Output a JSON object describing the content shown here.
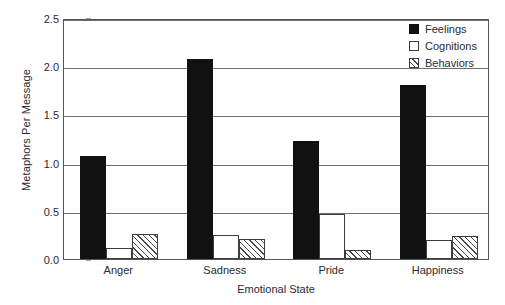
{
  "chart_data": {
    "type": "bar",
    "title": "",
    "subtitle": "",
    "xlabel": "Emotional State",
    "ylabel": "Metaphors Per Message",
    "categories": [
      "Anger",
      "Sadness",
      "Pride",
      "Happiness"
    ],
    "series": [
      {
        "name": "Feelings",
        "values": [
          1.07,
          2.07,
          1.22,
          1.8
        ]
      },
      {
        "name": "Cognitions",
        "values": [
          0.11,
          0.25,
          0.47,
          0.2
        ]
      },
      {
        "name": "Behaviors",
        "values": [
          0.26,
          0.21,
          0.09,
          0.24
        ]
      }
    ],
    "ylim": [
      0.0,
      2.5
    ],
    "ytick_labels": [
      "0.0",
      "0.5",
      "1.0",
      "1.5",
      "2.0",
      "2.5"
    ],
    "ytick_values": [
      0.0,
      0.5,
      1.0,
      1.5,
      2.0,
      2.5
    ],
    "grid": "horizontal",
    "legend_position": "top-right-inside",
    "colors": {
      "feelings": "#111111",
      "cognitions": "#ffffff",
      "behaviors_hatch": "#4a4a4a",
      "axis": "#555555",
      "gridline": "#6d6d6d",
      "text": "#2b2b2b",
      "background": "#ffffff"
    }
  },
  "legend": {
    "items": [
      {
        "label": "Feelings",
        "style": "solid-black"
      },
      {
        "label": "Cognitions",
        "style": "white-outline"
      },
      {
        "label": "Behaviors",
        "style": "diagonal-hatch"
      }
    ]
  }
}
